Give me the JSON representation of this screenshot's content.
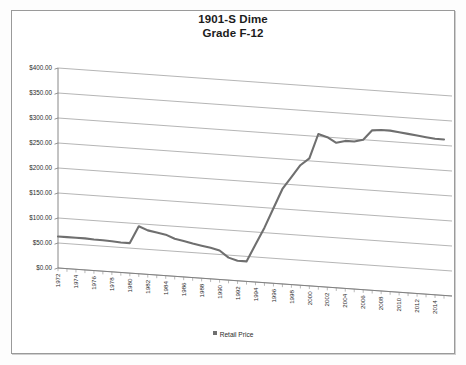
{
  "chart_data": {
    "type": "line",
    "title": "1901-S Dime",
    "subtitle": "Grade F-12",
    "title_line1": "1901-S Dime",
    "title_line2": "Grade F-12",
    "xlabel": "",
    "ylabel": "",
    "ylim": [
      0,
      400
    ],
    "ytick_step": 50,
    "grid": true,
    "legend_position": "bottom",
    "legend": [
      "Retail Price"
    ],
    "ytick_labels": [
      "$0.00",
      "$50.00",
      "$100.00",
      "$150.00",
      "$200.00",
      "$250.00",
      "$300.00",
      "$350.00",
      "$400.00"
    ],
    "ytick_values": [
      0,
      50,
      100,
      150,
      200,
      250,
      300,
      350,
      400
    ],
    "categories": [
      "1972",
      "1973",
      "1974",
      "1975",
      "1976",
      "1977",
      "1978",
      "1979",
      "1980",
      "1981",
      "1982",
      "1983",
      "1984",
      "1985",
      "1986",
      "1987",
      "1988",
      "1989",
      "1990",
      "1991",
      "1992",
      "1993",
      "1994",
      "1995",
      "1996",
      "1997",
      "1998",
      "1999",
      "2000",
      "2001",
      "2002",
      "2003",
      "2004",
      "2005",
      "2006",
      "2007",
      "2008",
      "2009",
      "2010",
      "2011",
      "2012",
      "2013",
      "2014",
      "2015"
    ],
    "xtick_labels": [
      "1972",
      "1974",
      "1976",
      "1978",
      "1980",
      "1982",
      "1984",
      "1986",
      "1988",
      "1990",
      "1992",
      "1994",
      "1996",
      "1998",
      "2000",
      "2002",
      "2004",
      "2006",
      "2008",
      "2010",
      "2012",
      "2014"
    ],
    "series": [
      {
        "name": "Retail Price",
        "color": "#6f6f6f",
        "values": [
          63,
          63,
          63,
          63,
          62,
          62,
          61,
          60,
          60,
          95,
          88,
          85,
          82,
          75,
          72,
          68,
          65,
          62,
          58,
          45,
          40,
          40,
          75,
          110,
          150,
          190,
          215,
          240,
          255,
          305,
          300,
          290,
          295,
          295,
          300,
          320,
          322,
          322,
          320,
          318,
          316,
          314,
          312,
          312
        ]
      }
    ]
  }
}
